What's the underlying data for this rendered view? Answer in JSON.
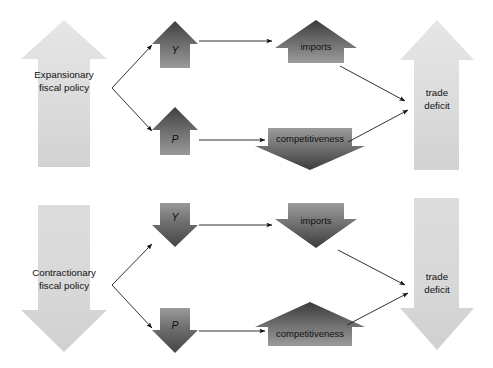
{
  "figure": {
    "title": "",
    "panels": [
      {
        "id": "expansionary",
        "policy_label_line1": "Expansionary",
        "policy_label_line2": "fiscal policy",
        "policy_arrow_direction": "up",
        "nodes": [
          {
            "id": "y",
            "label": "Y",
            "direction": "up",
            "italic": true
          },
          {
            "id": "p",
            "label": "P",
            "direction": "up",
            "italic": true
          },
          {
            "id": "imports",
            "label": "imports",
            "direction": "up",
            "italic": false
          },
          {
            "id": "competitiveness",
            "label": "competitiveness",
            "direction": "down",
            "italic": false
          }
        ],
        "outcome_label_line1": "trade",
        "outcome_label_line2": "deficit",
        "outcome_direction": "up"
      },
      {
        "id": "contractionary",
        "policy_label_line1": "Contractionary",
        "policy_label_line2": "fiscal policy",
        "policy_arrow_direction": "down",
        "nodes": [
          {
            "id": "y",
            "label": "Y",
            "direction": "down",
            "italic": true
          },
          {
            "id": "p",
            "label": "P",
            "direction": "down",
            "italic": true
          },
          {
            "id": "imports",
            "label": "imports",
            "direction": "down",
            "italic": false
          },
          {
            "id": "competitiveness",
            "label": "competitiveness",
            "direction": "up",
            "italic": false
          }
        ],
        "outcome_label_line1": "trade",
        "outcome_label_line2": "deficit",
        "outcome_direction": "down"
      }
    ]
  },
  "colors": {
    "pale_arrow_light": "#e3e3e3",
    "pale_arrow_dark": "#cfcfcf",
    "mid_arrow_dark": "#4d4d4d",
    "mid_arrow_light": "#949494",
    "connector": "#1a1a1a",
    "text": "#111111",
    "background": "#ffffff"
  }
}
